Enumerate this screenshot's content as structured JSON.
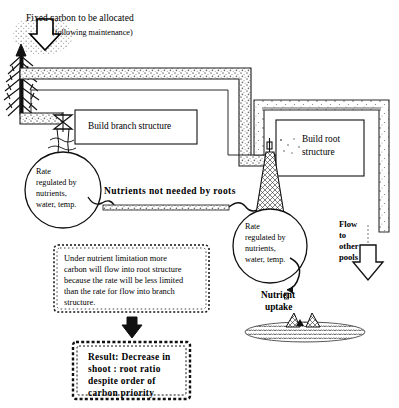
{
  "diagram": {
    "title": "Fixed carbon to be allocated",
    "subtitle": "(following maintenance)",
    "boxes": {
      "branch": "Build branch structure",
      "root": "Build root\nstructure",
      "root_line1": "Build root",
      "root_line2": "structure"
    },
    "balloons": {
      "left": {
        "line1": "Rate",
        "line2": "regulated by",
        "line3": "nutrients,",
        "line4": "water, temp."
      },
      "right": {
        "line1": "Rate",
        "line2": "regulated by",
        "line3": "nutrients,",
        "line4": "water, temp."
      }
    },
    "pipe_label": "Nutrients not needed by roots",
    "flow_other_pools": {
      "line1": "Flow",
      "line2": "to",
      "line3": "other",
      "line4": "pools"
    },
    "nutrient_uptake": {
      "line1": "Nutrient",
      "line2": "uptake"
    },
    "note_box": {
      "line1": "Under nutrient limitation more",
      "line2": "carbon will flow into root structure",
      "line3": "because the rate will be less limited",
      "line4": "than the rate for flow into branch",
      "line5": "structure."
    },
    "result_box": {
      "line1": "Result:  Decrease in",
      "line2": "shoot : root ratio",
      "line3": "despite order of",
      "line4": "carbon  priority"
    },
    "icons": {
      "carbon_input_arrow": "down-arrow-icon",
      "tree": "conifer-tree-icon",
      "branch_valve": "valve-icon",
      "root_valve": "valve-icon",
      "note_to_result_arrow": "down-arrow-icon",
      "flow_pools_arrow": "down-arrow-icon",
      "soil": "soil-layer-icon",
      "root_tips": "root-uptake-icon"
    },
    "colors": {
      "ink": "#000000",
      "paper": "#ffffff",
      "stipple": "#8a8a8a",
      "soil": "#6f6f6f"
    }
  }
}
